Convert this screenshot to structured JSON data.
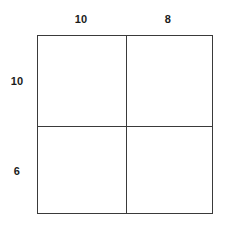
{
  "figure": {
    "kind": "rectangle-partition-diagram",
    "stroke_color": "#3a3a3a",
    "fill_color": "#ffffff",
    "label_color": "#1b1b1b"
  },
  "labels": {
    "top_left": "10",
    "top_right": "8",
    "left_top": "10",
    "left_bottom": "6"
  },
  "chart_data": {
    "type": "table",
    "title": "",
    "xlabel": "",
    "ylabel": "",
    "column_widths": [
      10,
      8
    ],
    "row_heights": [
      10,
      6
    ],
    "categories": [
      "10",
      "8"
    ],
    "rows": [
      "10",
      "6"
    ],
    "cells": [
      [
        {
          "width": 10,
          "height": 10,
          "label": ""
        },
        {
          "width": 8,
          "height": 10,
          "label": ""
        }
      ],
      [
        {
          "width": 10,
          "height": 6,
          "label": ""
        },
        {
          "width": 8,
          "height": 6,
          "label": ""
        }
      ]
    ],
    "grid": true,
    "legend": "none"
  }
}
